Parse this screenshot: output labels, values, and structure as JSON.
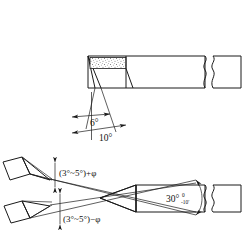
{
  "drawing": {
    "title": "Turning tool geometry dimensioned drawing",
    "background_color": "#ffffff",
    "line_color": "#1a1a1a",
    "stipple_color": "#333333",
    "width": 248,
    "height": 239,
    "views": [
      {
        "id": "side-view",
        "name": "side-elevation-view",
        "description": "Side elevation of lathe tool shank with brazed carbide insert, showing rake and clearance angles",
        "labels": [
          {
            "id": "angle-6",
            "text": "6°",
            "x": 96,
            "y": 122
          },
          {
            "id": "angle-10",
            "text": "10°",
            "x": 106,
            "y": 137
          }
        ]
      },
      {
        "id": "plan-view",
        "name": "plan-top-view",
        "description": "Plan view of tool showing included point angle with tolerance and two detail wedges of the cutting tip",
        "labels": [
          {
            "id": "angle-upper",
            "text": "(3°~5°)+φ",
            "x": 61,
            "y": 174
          },
          {
            "id": "angle-lower",
            "text": "(3°~5°)−φ",
            "x": 63,
            "y": 219
          },
          {
            "id": "angle-30",
            "text": "30°",
            "x": 170,
            "y": 200
          },
          {
            "id": "tol-upper",
            "text": "0",
            "x": 185,
            "y": 194
          },
          {
            "id": "tol-lower",
            "text": "-10′",
            "x": 184,
            "y": 202
          }
        ]
      }
    ],
    "icons": [
      {
        "name": "break-line-icon",
        "count": 2
      },
      {
        "name": "stipple-hatch-icon",
        "count": 4
      },
      {
        "name": "dimension-arrow-icon",
        "count": 8
      }
    ]
  }
}
